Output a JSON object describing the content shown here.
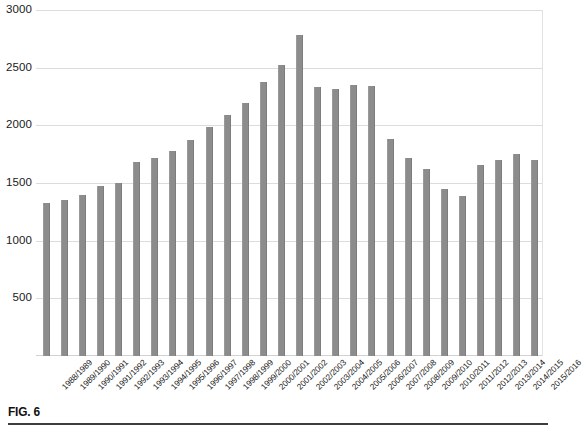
{
  "figure": {
    "label": "FIG. 6"
  },
  "chart_data": {
    "type": "bar",
    "title": "",
    "xlabel": "",
    "ylabel": "",
    "ylim": [
      0,
      3000
    ],
    "yticks": [
      3000,
      2500,
      2000,
      1500,
      1000,
      500
    ],
    "ytick_labels": [
      "3000",
      "2500",
      "2000",
      "1500",
      "1000",
      "500"
    ],
    "grid": true,
    "legend": "none",
    "bar_color": "#8c8c8c",
    "categories": [
      "1988/1989",
      "1989/1990",
      "1990/1991",
      "1991/1992",
      "1992/1993",
      "1993/1994",
      "1994/1995",
      "1995/1996",
      "1996/1997",
      "1997/1998",
      "1998/1999",
      "1999/2000",
      "2000/2001",
      "2001/2002",
      "2002/2003",
      "2003/2004",
      "2004/2005",
      "2005/2006",
      "2006/2007",
      "2007/2008",
      "2008/2009",
      "2009/2010",
      "2010/2011",
      "2011/2012",
      "2012/2013",
      "2013/2014",
      "2014/2015",
      "2015/2016"
    ],
    "values": [
      1330,
      1355,
      1400,
      1470,
      1500,
      1680,
      1715,
      1775,
      1875,
      1990,
      2090,
      2190,
      2380,
      2520,
      2780,
      2330,
      2315,
      2350,
      2345,
      1885,
      1715,
      1620,
      1450,
      1390,
      1655,
      1700,
      1755,
      1700
    ]
  }
}
